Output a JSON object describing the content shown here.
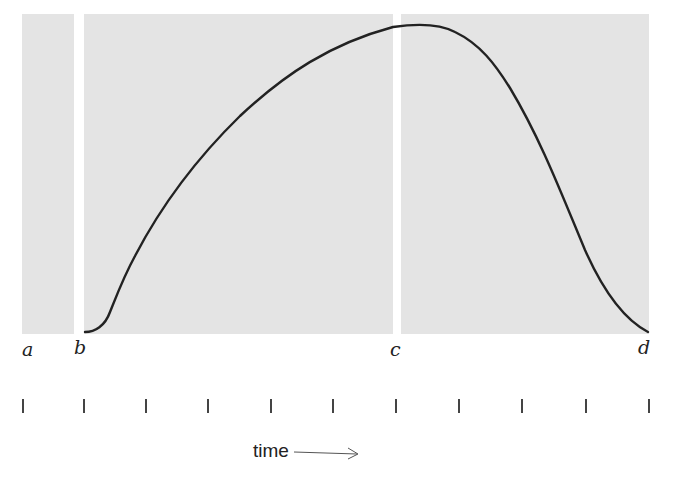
{
  "labels": {
    "a": "a",
    "b": "b",
    "c": "c",
    "d": "d"
  },
  "axis": {
    "label": "time",
    "arrow": "right-arrow",
    "tick_count": 11
  },
  "curve": {
    "description": "rises from b, peaks near c, falls to zero at d",
    "color": "#222222"
  },
  "panels": {
    "fill": "#e4e4e4",
    "regions": [
      "a-b",
      "b-c",
      "c-d"
    ]
  }
}
